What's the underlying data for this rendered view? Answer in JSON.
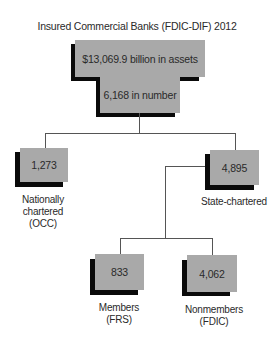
{
  "title": "Insured Commercial Banks (FDIC-DIF) 2012",
  "colors": {
    "box_fill": "#a9a9a9",
    "shadow": "#0a0a0a",
    "connector": "#555555",
    "background": "#ffffff"
  },
  "root": {
    "assets": "$13,069.9 billion in assets",
    "number": "6,168 in number"
  },
  "nodes": {
    "national": {
      "value": "1,273",
      "label_lines": [
        "Nationally",
        "chartered",
        "(OCC)"
      ]
    },
    "state": {
      "value": "4,895",
      "label_lines": [
        "State-chartered"
      ]
    },
    "members": {
      "value": "833",
      "label_lines": [
        "Members",
        "(FRS)"
      ]
    },
    "nonmembers": {
      "value": "4,062",
      "label_lines": [
        "Nonmembers",
        "(FDIC)"
      ]
    }
  }
}
